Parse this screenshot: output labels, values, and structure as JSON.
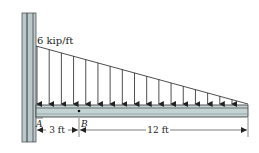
{
  "diagram": {
    "type": "cantilever-beam-triangular-load",
    "load": {
      "label": "6 kip/ft",
      "max_intensity": 6,
      "unit": "kip/ft",
      "distribution": "linearly decreasing from wall to free end",
      "arrow_count": 17
    },
    "points": {
      "A": "A",
      "B": "B"
    },
    "dimensions": [
      {
        "label": "3 ft",
        "from": "A",
        "to": "B"
      },
      {
        "label": "12 ft",
        "from": "B",
        "to": "free-end"
      }
    ],
    "colors": {
      "wall": "#b9c9cc",
      "beam": "#c3d3d4",
      "line": "#2a2a2a"
    }
  }
}
